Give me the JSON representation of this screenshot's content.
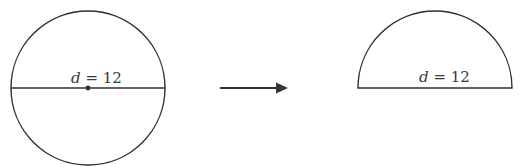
{
  "figure": {
    "stroke_color": "#2f2f2f",
    "circle": {
      "cx": 88,
      "cy": 88,
      "r": 77,
      "diameter_label_var": "d",
      "diameter_label_rest": " = 12",
      "diameter_value": 12,
      "has_center_dot": true
    },
    "arrow": {
      "x1": 220,
      "x2": 287,
      "y": 88,
      "direction": "right"
    },
    "semicircle": {
      "cx": 435,
      "cy": 88,
      "r": 77,
      "diameter_label_var": "d",
      "diameter_label_rest": " = 12",
      "diameter_value": 12
    }
  }
}
